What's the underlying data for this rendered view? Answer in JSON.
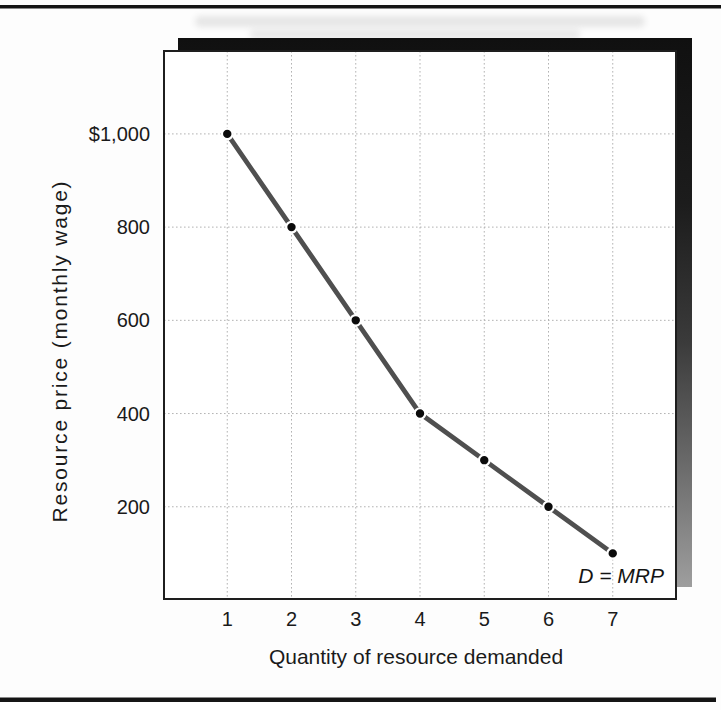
{
  "chart_data": {
    "type": "line",
    "title": "",
    "xlabel": "Quantity of resource demanded",
    "ylabel": "Resource price (monthly wage)",
    "annotation": "D = MRP",
    "x": [
      1,
      2,
      3,
      4,
      5,
      6,
      7
    ],
    "y": [
      1000,
      800,
      600,
      400,
      300,
      200,
      100
    ],
    "x_tick_labels": [
      "1",
      "2",
      "3",
      "4",
      "5",
      "6",
      "7"
    ],
    "y_ticks": [
      200,
      400,
      600,
      800,
      1000
    ],
    "y_tick_labels": [
      "200",
      "400",
      "600",
      "800",
      "$1,000"
    ],
    "xlim": [
      0,
      8
    ],
    "ylim": [
      0,
      1180
    ],
    "grid": true,
    "legend": "none",
    "line_color": "#4f4f4f",
    "marker_color": "#0b0b0b",
    "grid_color": "#b3b3b3",
    "shadow_top_color": "#101010",
    "shadow_bottom_color": "#9e9e9e",
    "rule_color": "#141414"
  }
}
